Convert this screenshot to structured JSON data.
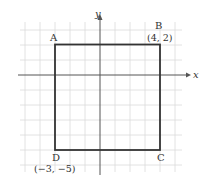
{
  "diagram": {
    "type": "coordinate-plane",
    "axes": {
      "x_label": "x",
      "y_label": "y"
    },
    "shape": "square",
    "vertices": [
      {
        "name": "A",
        "coord_label": "",
        "x": -3,
        "y": 2
      },
      {
        "name": "B",
        "coord_label": "(4, 2)",
        "x": 4,
        "y": 2
      },
      {
        "name": "C",
        "coord_label": "",
        "x": 4,
        "y": -5
      },
      {
        "name": "D",
        "coord_label": "(−3, −5)",
        "x": -3,
        "y": -5
      }
    ],
    "colors": {
      "grid": "#d4d4d4",
      "axes": "#555555",
      "shape": "#333333",
      "text": "#333333"
    }
  }
}
